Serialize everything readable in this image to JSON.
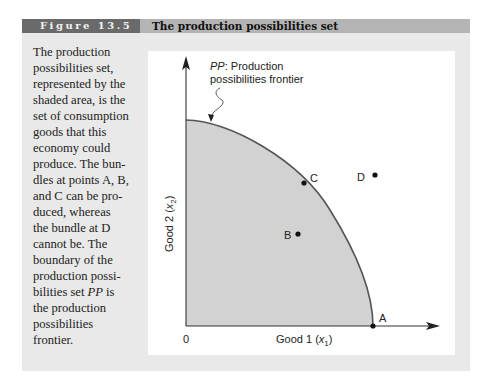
{
  "figure": {
    "label": "Figure 13.5",
    "title": "The production possibilities set"
  },
  "caption": {
    "lines": [
      "The production",
      "possibilities set,",
      "represented by the",
      "shaded area, is the",
      "set of consumption",
      "goods that this",
      "economy could",
      "produce. The bun-",
      "dles at points A, B,",
      "and C can be pro-",
      "duced, whereas",
      "the bundle at D",
      "cannot be. The",
      "boundary of the",
      "production possi-",
      "bilities set PP is",
      "the production",
      "possibilities",
      "frontier."
    ]
  },
  "diagram": {
    "annotation_italic": "PP",
    "annotation_line1": ": Production",
    "annotation_line2": "possibilities frontier",
    "x_axis_label_main": "Good 1 (",
    "x_axis_label_var": "x",
    "x_axis_label_sub": "1",
    "y_axis_label_main": "Good 2 (",
    "y_axis_label_var": "x",
    "y_axis_label_sub": "2",
    "origin_label": "0",
    "points": {
      "A": "A",
      "B": "B",
      "C": "C",
      "D": "D"
    },
    "colors": {
      "shaded_region": "#d2d2d2",
      "frontier": "#555555",
      "axis": "#333333"
    }
  }
}
